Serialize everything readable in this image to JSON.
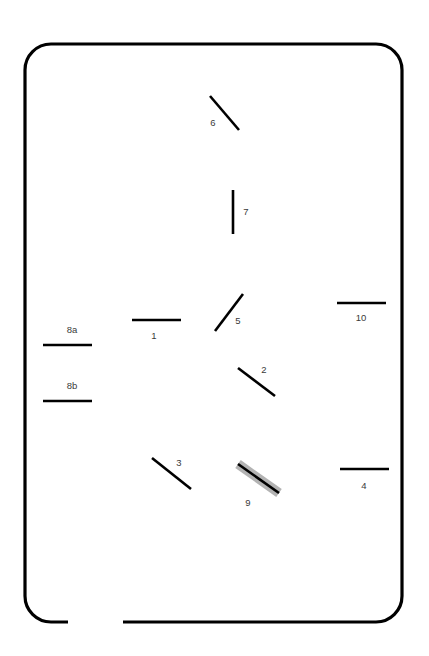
{
  "figure": {
    "canvas": {
      "width": 429,
      "height": 656
    },
    "background_color": "#ffffff",
    "stroke_color": "#000000",
    "label_color": "#3a3a3a",
    "highlight_color": "#b3b3b3"
  },
  "frame": {
    "name": "rounded-rectangle-border",
    "x": 25,
    "y": 44,
    "width": 377,
    "height": 578,
    "corner_radius": 26,
    "stroke_width": 3.2,
    "gap": {
      "description": "open gap along bottom edge",
      "x_start": 68,
      "x_end": 123,
      "y": 622
    }
  },
  "segments": [
    {
      "label": "1",
      "orientation": "horizontal",
      "x1": 132,
      "y1": 320,
      "x2": 181,
      "y2": 320,
      "label_x": 154,
      "label_y": 336,
      "highlighted": false
    },
    {
      "label": "2",
      "orientation": "diagonal-down-right",
      "x1": 238,
      "y1": 368,
      "x2": 275,
      "y2": 396,
      "label_x": 264,
      "label_y": 370,
      "highlighted": false
    },
    {
      "label": "3",
      "orientation": "diagonal-down-right",
      "x1": 152,
      "y1": 458,
      "x2": 191,
      "y2": 489,
      "label_x": 179,
      "label_y": 463,
      "highlighted": false
    },
    {
      "label": "4",
      "orientation": "horizontal",
      "x1": 340,
      "y1": 469,
      "x2": 389,
      "y2": 469,
      "label_x": 364,
      "label_y": 486,
      "highlighted": false
    },
    {
      "label": "5",
      "orientation": "diagonal-up-right",
      "x1": 215,
      "y1": 331,
      "x2": 243,
      "y2": 294,
      "label_x": 238,
      "label_y": 321,
      "highlighted": false
    },
    {
      "label": "6",
      "orientation": "diagonal-down-right",
      "x1": 210,
      "y1": 96,
      "x2": 239,
      "y2": 130,
      "label_x": 213,
      "label_y": 123,
      "highlighted": false
    },
    {
      "label": "7",
      "orientation": "vertical",
      "x1": 233,
      "y1": 190,
      "x2": 233,
      "y2": 234,
      "label_x": 246,
      "label_y": 212,
      "highlighted": false
    },
    {
      "label": "8a",
      "orientation": "horizontal",
      "x1": 43,
      "y1": 345,
      "x2": 92,
      "y2": 345,
      "label_x": 72,
      "label_y": 330,
      "highlighted": false
    },
    {
      "label": "8b",
      "orientation": "horizontal",
      "x1": 43,
      "y1": 401,
      "x2": 92,
      "y2": 401,
      "label_x": 72,
      "label_y": 386,
      "highlighted": false
    },
    {
      "label": "9",
      "orientation": "diagonal-down-right",
      "x1": 238,
      "y1": 464,
      "x2": 279,
      "y2": 493,
      "label_x": 248,
      "label_y": 503,
      "highlighted": true
    },
    {
      "label": "10",
      "orientation": "horizontal",
      "x1": 337,
      "y1": 303,
      "x2": 386,
      "y2": 303,
      "label_x": 361,
      "label_y": 318,
      "highlighted": false
    }
  ]
}
